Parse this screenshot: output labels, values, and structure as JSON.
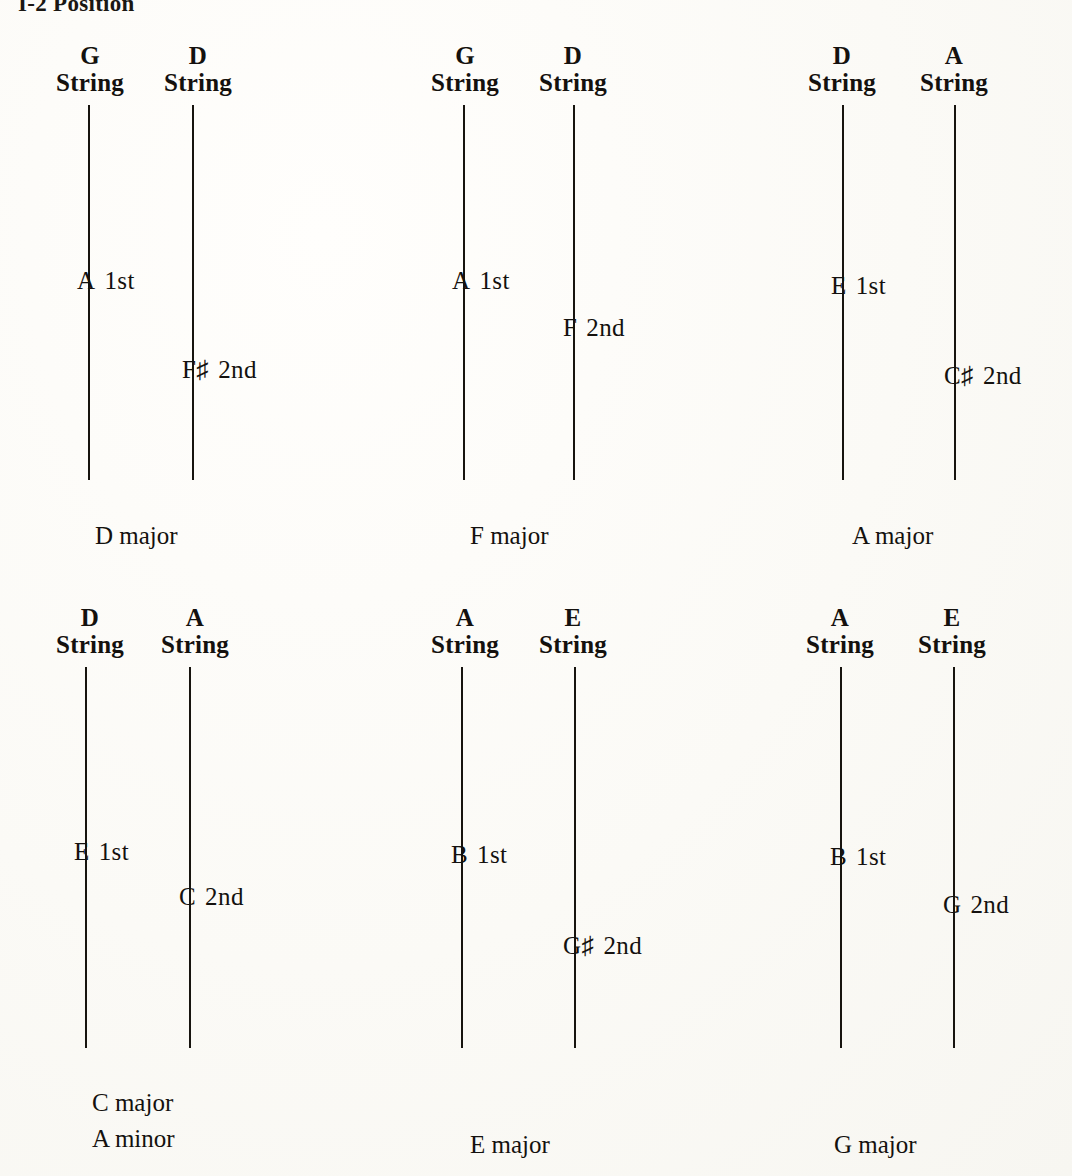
{
  "page": {
    "title": "I-2 Position",
    "background_color": "#fdfdfb",
    "ink_color": "#14110e"
  },
  "diagrams": [
    {
      "id": "d-major",
      "caption_lines": [
        "D major"
      ],
      "strings": [
        {
          "head_note": "G",
          "head_word": "String",
          "marker_note": "A",
          "marker_accidental": "",
          "marker_finger": "1st"
        },
        {
          "head_note": "D",
          "head_word": "String",
          "marker_note": "F",
          "marker_accidental": "♯",
          "marker_finger": "2nd"
        }
      ]
    },
    {
      "id": "f-major",
      "caption_lines": [
        "F major"
      ],
      "strings": [
        {
          "head_note": "G",
          "head_word": "String",
          "marker_note": "A",
          "marker_accidental": "",
          "marker_finger": "1st"
        },
        {
          "head_note": "D",
          "head_word": "String",
          "marker_note": "F",
          "marker_accidental": "",
          "marker_finger": "2nd"
        }
      ]
    },
    {
      "id": "a-major",
      "caption_lines": [
        "A major"
      ],
      "strings": [
        {
          "head_note": "D",
          "head_word": "String",
          "marker_note": "E",
          "marker_accidental": "",
          "marker_finger": "1st"
        },
        {
          "head_note": "A",
          "head_word": "String",
          "marker_note": "C",
          "marker_accidental": "♯",
          "marker_finger": "2nd"
        }
      ]
    },
    {
      "id": "c-major-a-minor",
      "caption_lines": [
        "C major",
        "A minor"
      ],
      "strings": [
        {
          "head_note": "D",
          "head_word": "String",
          "marker_note": "E",
          "marker_accidental": "",
          "marker_finger": "1st"
        },
        {
          "head_note": "A",
          "head_word": "String",
          "marker_note": "C",
          "marker_accidental": "",
          "marker_finger": "2nd"
        }
      ]
    },
    {
      "id": "e-major",
      "caption_lines": [
        "E major"
      ],
      "strings": [
        {
          "head_note": "A",
          "head_word": "String",
          "marker_note": "B",
          "marker_accidental": "",
          "marker_finger": "1st"
        },
        {
          "head_note": "E",
          "head_word": "String",
          "marker_note": "G",
          "marker_accidental": "♯",
          "marker_finger": "2nd"
        }
      ]
    },
    {
      "id": "g-major",
      "caption_lines": [
        "G major"
      ],
      "strings": [
        {
          "head_note": "A",
          "head_word": "String",
          "marker_note": "B",
          "marker_accidental": "",
          "marker_finger": "1st"
        },
        {
          "head_note": "E",
          "head_word": "String",
          "marker_note": "G",
          "marker_accidental": "",
          "marker_finger": "2nd"
        }
      ]
    }
  ]
}
